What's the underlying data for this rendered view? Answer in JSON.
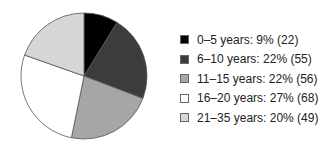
{
  "chart_data": {
    "type": "pie",
    "title": "",
    "categories": [
      "0–5 years",
      "6–10 years",
      "11–15 years",
      "16–20 years",
      "21–35 years"
    ],
    "values": [
      22,
      55,
      56,
      68,
      49
    ],
    "percentages": [
      9,
      22,
      22,
      27,
      20
    ],
    "colors": [
      "#000000",
      "#3c3c3c",
      "#a6a6a6",
      "#ffffff",
      "#d6d6d6"
    ],
    "start_angle_deg": 0,
    "direction": "clockwise",
    "legend_position": "right",
    "legend": [
      "0–5 years: 9% (22)",
      "6–10 years: 22% (55)",
      "11–15 years: 22% (56)",
      "16–20 years: 27% (68)",
      "21–35 years: 20% (49)"
    ]
  }
}
